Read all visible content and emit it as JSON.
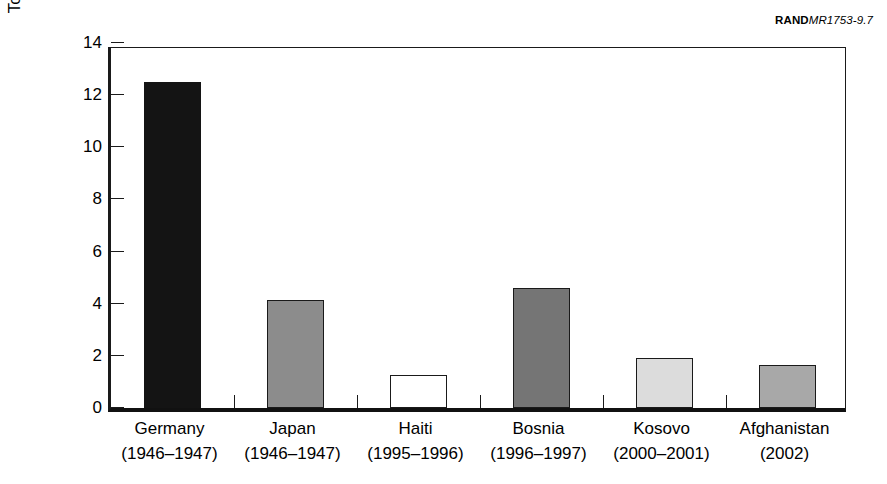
{
  "credit": {
    "brand": "RAND",
    "document_id": "MR1753-9.7"
  },
  "chart_data": {
    "type": "bar",
    "title": "",
    "xlabel": "",
    "ylabel": "Total assistance (billions of US$)",
    "ylim": [
      0,
      14
    ],
    "yticks": [
      0,
      2,
      4,
      6,
      8,
      10,
      12,
      14
    ],
    "ytick_labels": [
      "0",
      "2",
      "4",
      "6",
      "8",
      "10",
      "12",
      "14"
    ],
    "grid": false,
    "legend": "none",
    "categories": [
      "Germany (1946–1947)",
      "Japan (1946–1947)",
      "Haiti (1995–1996)",
      "Bosnia (1996–1997)",
      "Kosovo (2000–2001)",
      "Afghanistan (2002)"
    ],
    "values": [
      12.5,
      4.15,
      1.25,
      4.6,
      1.9,
      1.65
    ],
    "bars": [
      {
        "name": "Germany",
        "period": "(1946–1947)",
        "value": 12.5,
        "color": "#141414"
      },
      {
        "name": "Japan",
        "period": "(1946–1947)",
        "value": 4.15,
        "color": "#8c8c8c"
      },
      {
        "name": "Haiti",
        "period": "(1995–1996)",
        "value": 1.25,
        "color": "#ffffff"
      },
      {
        "name": "Bosnia",
        "period": "(1996–1997)",
        "value": 4.6,
        "color": "#757575"
      },
      {
        "name": "Kosovo",
        "period": "(2000–2001)",
        "value": 1.9,
        "color": "#dcdcdc"
      },
      {
        "name": "Afghanistan",
        "period": "(2002)",
        "value": 1.65,
        "color": "#a8a8a8"
      }
    ]
  }
}
